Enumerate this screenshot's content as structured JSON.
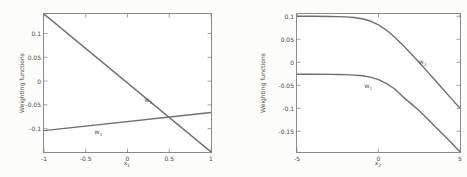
{
  "figure": {
    "background": "#fcfcfb",
    "plot_background": "#ffffff",
    "line_color": "#6e6e6e",
    "axis_color": "#8a8a8a",
    "text_color": "#4a4a4a"
  },
  "chart_data": [
    {
      "type": "line",
      "title": "",
      "ylabel": "Weighting functions",
      "xlabel_base": "x",
      "xlabel_sub": "1",
      "xlim": [
        -1,
        1
      ],
      "ylim": [
        -0.149,
        0.141
      ],
      "grid": false,
      "legend": "none (inline curve labels)",
      "xtick_values": [
        -1,
        -0.5,
        0,
        0.5,
        1
      ],
      "xtick_labels": [
        "-1",
        "-0.5",
        "0",
        "0.5",
        "1"
      ],
      "ytick_values": [
        0.1,
        0.05,
        0,
        -0.05,
        -0.1
      ],
      "ytick_labels": [
        "0.1",
        "0.05",
        "0",
        "-0.05",
        "-0.1"
      ],
      "series": [
        {
          "label_base": "w",
          "label_sub": "2",
          "x": [
            -1,
            1
          ],
          "y": [
            0.141,
            -0.149
          ],
          "label_pos": {
            "x": 0.25,
            "y": -0.04
          }
        },
        {
          "label_base": "w",
          "label_sub": "1",
          "x": [
            -1,
            1
          ],
          "y": [
            -0.104,
            -0.066
          ],
          "label_pos": {
            "x": -0.35,
            "y": -0.108
          }
        }
      ]
    },
    {
      "type": "line",
      "title": "",
      "ylabel": "Weighting functions",
      "xlabel_base": "x",
      "xlabel_sub": "2",
      "xlim": [
        -5,
        5
      ],
      "ylim": [
        -0.195,
        0.105
      ],
      "grid": false,
      "legend": "none (inline curve labels)",
      "xtick_values": [
        -5,
        0,
        5
      ],
      "xtick_labels": [
        "-5",
        "0",
        "5"
      ],
      "ytick_values": [
        0.1,
        0.05,
        0,
        -0.05,
        -0.1,
        -0.15
      ],
      "ytick_labels": [
        "0.1",
        "0.05",
        "0",
        "-0.05",
        "-0.1",
        "-0.15"
      ],
      "series": [
        {
          "label_base": "w",
          "label_sub": "2",
          "x": [
            -5,
            -4,
            -3,
            -2.5,
            -2,
            -1.5,
            -1,
            -0.5,
            0,
            0.5,
            1,
            1.5,
            2,
            2.5,
            3,
            3.5,
            4,
            4.5,
            5
          ],
          "y": [
            0.1,
            0.1,
            0.0997,
            0.0994,
            0.0987,
            0.0973,
            0.0946,
            0.0897,
            0.0815,
            0.0697,
            0.0546,
            0.0373,
            0.0187,
            -0.0006,
            -0.0203,
            -0.0401,
            -0.0601,
            -0.0801,
            -0.1
          ],
          "label_pos": {
            "x": 2.7,
            "y": 0.0
          }
        },
        {
          "label_base": "w",
          "label_sub": "1",
          "x": [
            -5,
            -4,
            -3,
            -2.5,
            -2,
            -1.5,
            -1,
            -0.5,
            0,
            0.5,
            1,
            1.5,
            2,
            2.5,
            3,
            3.5,
            4,
            4.5,
            5
          ],
          "y": [
            -0.026,
            -0.026,
            -0.0262,
            -0.0264,
            -0.0268,
            -0.0278,
            -0.0293,
            -0.0322,
            -0.0377,
            -0.0463,
            -0.0581,
            -0.0751,
            -0.0898,
            -0.1054,
            -0.1228,
            -0.1404,
            -0.1582,
            -0.176,
            -0.195
          ],
          "label_pos": {
            "x": -0.62,
            "y": -0.052
          }
        }
      ]
    }
  ]
}
